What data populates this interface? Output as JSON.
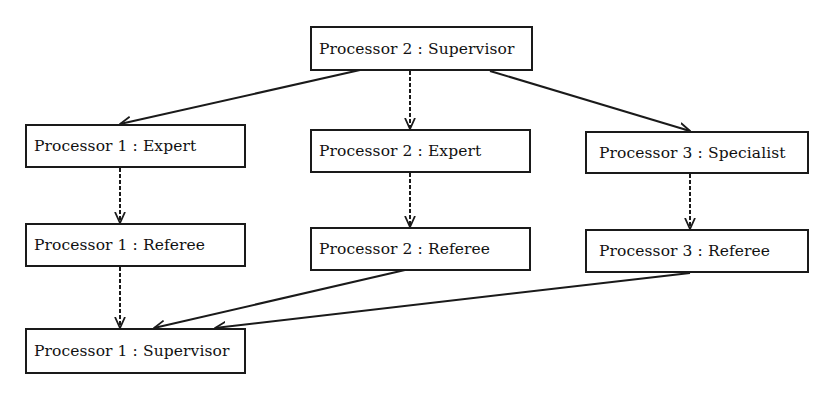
{
  "diagram": {
    "type": "task-flow",
    "colors": {
      "line": "#1a1a1a",
      "text": "#111111",
      "background": "#ffffff"
    },
    "nodes": {
      "p2_supervisor": {
        "label": "Processor 2 : Supervisor"
      },
      "p1_expert": {
        "label": "Processor 1 : Expert"
      },
      "p2_expert": {
        "label": "Processor 2 : Expert"
      },
      "p3_specialist": {
        "label": "Processor 3 : Specialist"
      },
      "p1_referee": {
        "label": "Processor 1 : Referee"
      },
      "p2_referee": {
        "label": "Processor 2 : Referee"
      },
      "p3_referee": {
        "label": "Processor 3 : Referee"
      },
      "p1_supervisor": {
        "label": "Processor 1 : Supervisor"
      }
    },
    "edges": [
      {
        "from": "Processor 2 : Supervisor",
        "to": "Processor 1 : Expert",
        "style": "solid"
      },
      {
        "from": "Processor 2 : Supervisor",
        "to": "Processor 2 : Expert",
        "style": "dashed"
      },
      {
        "from": "Processor 2 : Supervisor",
        "to": "Processor 3 : Specialist",
        "style": "solid"
      },
      {
        "from": "Processor 1 : Expert",
        "to": "Processor 1 : Referee",
        "style": "dashed"
      },
      {
        "from": "Processor 2 : Expert",
        "to": "Processor 2 : Referee",
        "style": "dashed"
      },
      {
        "from": "Processor 3 : Specialist",
        "to": "Processor 3 : Referee",
        "style": "dashed"
      },
      {
        "from": "Processor 1 : Referee",
        "to": "Processor 1 : Supervisor",
        "style": "dashed"
      },
      {
        "from": "Processor 2 : Referee",
        "to": "Processor 1 : Supervisor",
        "style": "solid"
      },
      {
        "from": "Processor 3 : Referee",
        "to": "Processor 1 : Supervisor",
        "style": "solid"
      }
    ]
  }
}
